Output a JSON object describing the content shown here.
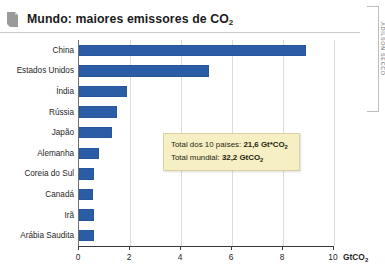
{
  "header": {
    "title_main": "Mundo: maiores emissores de CO",
    "title_sub": "2",
    "flag_icon": "bookmark-flag-icon"
  },
  "credit": {
    "text": "ADILSON SECCO"
  },
  "annotation": {
    "line1_label": "Total dos 10 países: ",
    "line1_value": "21,6 Gt*CO",
    "line1_sub": "2",
    "line2_label": "Total mundial: ",
    "line2_value": "32,2 GtCO",
    "line2_sub": "2",
    "fill_color": "#f7efc4",
    "border_color": "#ded0a0"
  },
  "chart_data": {
    "type": "bar",
    "orientation": "horizontal",
    "title": "Mundo: maiores emissores de CO2",
    "xlabel": "GtCO2",
    "ylabel": "",
    "xlim": [
      0,
      10
    ],
    "xticks": [
      0,
      2,
      4,
      6,
      8,
      10
    ],
    "xtick_labels": [
      "0",
      "2",
      "4",
      "6",
      "8",
      "10"
    ],
    "unit_label": "GtCO",
    "unit_sub": "2",
    "grid": true,
    "legend": "none",
    "bar_color": "#2b5da6",
    "categories": [
      "China",
      "Estados Unidos",
      "Índia",
      "Rússia",
      "Japão",
      "Alemanha",
      "Coreia do Sul",
      "Canadá",
      "Irã",
      "Arábia Saudita"
    ],
    "values": [
      8.9,
      5.1,
      1.9,
      1.5,
      1.3,
      0.8,
      0.6,
      0.55,
      0.6,
      0.6
    ],
    "annotations": [
      "Total dos 10 países: 21,6 Gt*CO2",
      "Total mundial: 32,2 GtCO2"
    ]
  }
}
